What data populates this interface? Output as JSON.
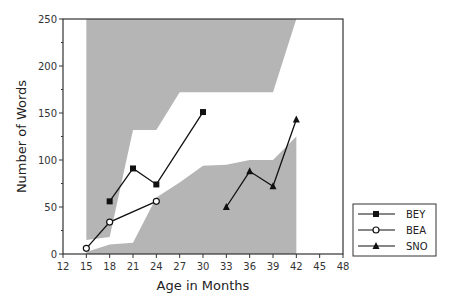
{
  "chart_data": {
    "type": "line",
    "title": "",
    "xlabel": "Age in Months",
    "ylabel": "Number of Words",
    "xlim": [
      12,
      48
    ],
    "ylim": [
      0,
      250
    ],
    "xticks": [
      12,
      15,
      18,
      21,
      24,
      27,
      30,
      33,
      36,
      39,
      42,
      45,
      48
    ],
    "yticks": [
      0,
      50,
      100,
      150,
      200,
      250
    ],
    "yminor_step": 25,
    "grid": false,
    "legend_position": "bottom-right",
    "series": [
      {
        "name": "BEY",
        "marker": "filled-square",
        "x": [
          18,
          21,
          24,
          30
        ],
        "values": [
          56,
          91,
          74,
          151
        ]
      },
      {
        "name": "BEA",
        "marker": "open-circle",
        "x": [
          15,
          18,
          24
        ],
        "values": [
          6,
          34,
          56
        ]
      },
      {
        "name": "SNO",
        "marker": "filled-triangle",
        "x": [
          33,
          36,
          39,
          42
        ],
        "values": [
          50,
          88,
          72,
          143
        ]
      }
    ],
    "shaded_regions": [
      {
        "name": "upper-range",
        "color": "#b5b5b5",
        "points": [
          [
            15,
            250
          ],
          [
            15,
            15
          ],
          [
            18,
            18
          ],
          [
            21,
            132
          ],
          [
            24,
            132
          ],
          [
            27,
            172
          ],
          [
            39,
            172
          ],
          [
            42,
            250
          ]
        ]
      },
      {
        "name": "lower-range",
        "color": "#b5b5b5",
        "points": [
          [
            15,
            0
          ],
          [
            15,
            2
          ],
          [
            18,
            10
          ],
          [
            21,
            12
          ],
          [
            24,
            60
          ],
          [
            27,
            76
          ],
          [
            30,
            94
          ],
          [
            33,
            95
          ],
          [
            36,
            100
          ],
          [
            39,
            100
          ],
          [
            42,
            125
          ],
          [
            42,
            0
          ]
        ]
      }
    ]
  }
}
